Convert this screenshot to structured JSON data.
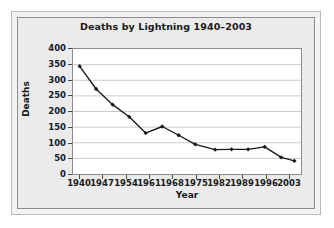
{
  "chart_data": {
    "type": "line",
    "title": "Deaths by Lightning 1940–2003",
    "xlabel": "Year",
    "ylabel": "Deaths",
    "xlim": [
      1938,
      2007
    ],
    "ylim": [
      0,
      400
    ],
    "ytick_step": 50,
    "yticks": [
      400,
      350,
      300,
      250,
      200,
      150,
      100,
      50,
      0
    ],
    "xticks": [
      1940,
      1947,
      1954,
      1961,
      1968,
      1975,
      1982,
      1989,
      1996,
      2003
    ],
    "grid": "horizontal",
    "legend": "none",
    "marker": "diamond",
    "line_color": "#1a1a1a",
    "marker_color": "#1a1a1a",
    "plot_background": "#ffffff",
    "panel_background": "#ebebeb",
    "x": [
      1940,
      1945,
      1950,
      1955,
      1960,
      1965,
      1970,
      1975,
      1981,
      1986,
      1991,
      1996,
      2001,
      2005
    ],
    "values": [
      345,
      272,
      222,
      183,
      131,
      152,
      124,
      95,
      78,
      79,
      79,
      87,
      53,
      42
    ]
  },
  "figure": {
    "outer_border_color": "#b9b9b9",
    "inner_border_color": "#8c8c8c"
  }
}
